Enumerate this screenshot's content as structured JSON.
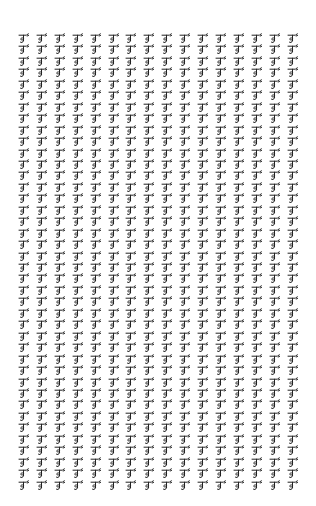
{
  "grid": {
    "columns": 16,
    "rows": 40,
    "col_spacing": 17.9,
    "row_spacing": 11.45,
    "glyph": "devanagari-like-conjunct-glyph",
    "glyph_color": "#222222",
    "background": "#ffffff"
  }
}
